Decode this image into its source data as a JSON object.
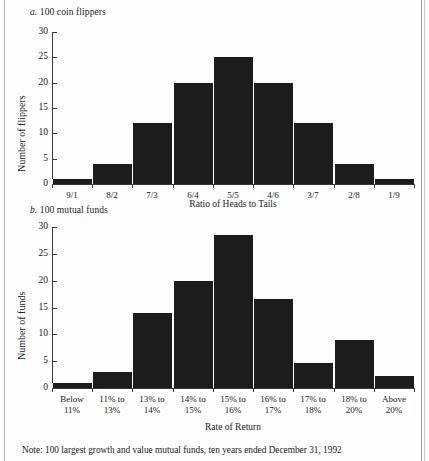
{
  "figure": {
    "note": "Note: 100 largest growth and value mutual funds, ten years ended December 31, 1992"
  },
  "panel_a": {
    "label": "a.",
    "title": "100 coin flippers"
  },
  "panel_b": {
    "label": "b.",
    "title": "100 mutual funds"
  },
  "chart_data": [
    {
      "type": "bar",
      "id": "coin-flippers",
      "title": "a. 100 coin flippers",
      "xlabel": "Ratio of Heads to Tails",
      "ylabel": "Number of flippers",
      "categories": [
        "9/1",
        "8/2",
        "7/3",
        "6/4",
        "5/5",
        "4/6",
        "3/7",
        "2/8",
        "1/9"
      ],
      "values": [
        1,
        4,
        12,
        20,
        25,
        20,
        12,
        4,
        1
      ],
      "ylim": [
        0,
        30
      ],
      "yticks": [
        0,
        5,
        10,
        15,
        20,
        25,
        30
      ],
      "ytick_labels": [
        "0",
        "5",
        "10",
        "15",
        "20",
        "25",
        "30"
      ],
      "grid": false,
      "legend": "none"
    },
    {
      "type": "bar",
      "id": "mutual-funds",
      "title": "b. 100 mutual funds",
      "xlabel": "Rate of Return",
      "ylabel": "Number of funds",
      "categories": [
        "Below\n11%",
        "11% to\n13%",
        "13% to\n14%",
        "14% to\n15%",
        "15% to\n16%",
        "16% to\n17%",
        "17% to\n18%",
        "18% to\n20%",
        "Above\n20%"
      ],
      "category_lines": [
        [
          "Below",
          "11%"
        ],
        [
          "11% to",
          "13%"
        ],
        [
          "13% to",
          "14%"
        ],
        [
          "14% to",
          "15%"
        ],
        [
          "15% to",
          "16%"
        ],
        [
          "16% to",
          "17%"
        ],
        [
          "17% to",
          "18%"
        ],
        [
          "18% to",
          "20%"
        ],
        [
          "Above",
          "20%"
        ]
      ],
      "values": [
        1,
        3,
        14,
        20,
        28.5,
        16.5,
        4.7,
        9,
        2.3
      ],
      "ylim": [
        0,
        30
      ],
      "yticks": [
        0,
        5,
        10,
        15,
        20,
        25,
        30
      ],
      "ytick_labels": [
        "0",
        "5",
        "10",
        "15",
        "20",
        "25",
        "30"
      ],
      "grid": false,
      "legend": "none"
    }
  ]
}
